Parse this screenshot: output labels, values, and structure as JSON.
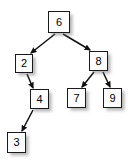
{
  "figure": {
    "background_color": "#ffffff",
    "node_fill_color": "#fdfdfd",
    "node_border_color": "#1a1a1a",
    "edge_color": "#111111",
    "label_color": "#000000"
  },
  "nodes": [
    {
      "id": "n6",
      "label": "6",
      "x": 48,
      "y": 11,
      "w": 22,
      "h": 22
    },
    {
      "id": "n2",
      "label": "2",
      "x": 15,
      "y": 54,
      "w": 18,
      "h": 19
    },
    {
      "id": "n8",
      "label": "8",
      "x": 89,
      "y": 51,
      "w": 19,
      "h": 20
    },
    {
      "id": "n4",
      "label": "4",
      "x": 30,
      "y": 89,
      "w": 19,
      "h": 20
    },
    {
      "id": "n7",
      "label": "7",
      "x": 67,
      "y": 88,
      "w": 19,
      "h": 20
    },
    {
      "id": "n9",
      "label": "9",
      "x": 103,
      "y": 88,
      "w": 19,
      "h": 20
    },
    {
      "id": "n3",
      "label": "3",
      "x": 7,
      "y": 132,
      "w": 19,
      "h": 21
    }
  ],
  "edges": [
    {
      "from": "n6",
      "to": "n2",
      "x1": 55,
      "y1": 34,
      "x2": 31,
      "y2": 53
    },
    {
      "from": "n6",
      "to": "n8",
      "x1": 63,
      "y1": 34,
      "x2": 90,
      "y2": 50
    },
    {
      "from": "n2",
      "to": "n4",
      "x1": 27,
      "y1": 74,
      "x2": 33,
      "y2": 88
    },
    {
      "from": "n4",
      "to": "n3",
      "x1": 33,
      "y1": 110,
      "x2": 22,
      "y2": 131
    },
    {
      "from": "n8",
      "to": "n7",
      "x1": 94,
      "y1": 72,
      "x2": 82,
      "y2": 87
    },
    {
      "from": "n8",
      "to": "n9",
      "x1": 103,
      "y1": 72,
      "x2": 110,
      "y2": 87
    }
  ]
}
